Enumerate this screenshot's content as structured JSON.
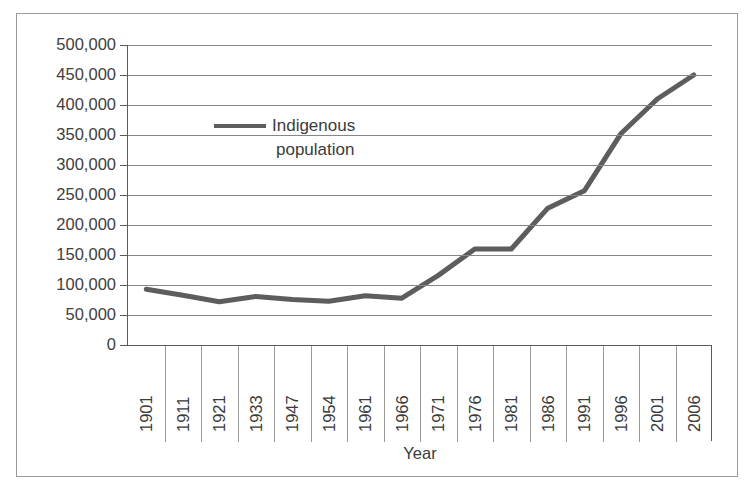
{
  "title_sliver": "",
  "legend": {
    "label_line1": "Indigenous",
    "label_line2": "population",
    "swatch_color": "#5d5d5d"
  },
  "axis": {
    "x_title": "Year",
    "y_tick_labels": [
      "500,000",
      "450,000",
      "400,000",
      "350,000",
      "300,000",
      "250,000",
      "200,000",
      "150,000",
      "100,000",
      "50,000",
      "0"
    ]
  },
  "chart_data": {
    "type": "line",
    "title": "",
    "xlabel": "Year",
    "ylabel": "",
    "ylim": [
      0,
      500000
    ],
    "ytick_step": 50000,
    "grid": true,
    "legend_position": "inside-upper-left",
    "categories": [
      "1901",
      "1911",
      "1921",
      "1933",
      "1947",
      "1954",
      "1961",
      "1966",
      "1971",
      "1976",
      "1981",
      "1986",
      "1991",
      "1996",
      "2001",
      "2006"
    ],
    "series": [
      {
        "name": "Indigenous population",
        "color": "#5d5d5d",
        "values": [
          93000,
          83000,
          72000,
          81000,
          76000,
          73000,
          82000,
          78000,
          116000,
          160000,
          160000,
          228000,
          257000,
          352000,
          410000,
          450000
        ]
      }
    ]
  }
}
